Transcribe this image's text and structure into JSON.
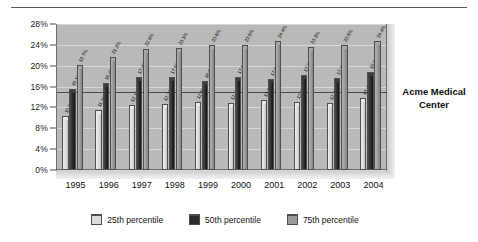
{
  "annotation": {
    "line1": "Acme Medical",
    "line2": "Center"
  },
  "legend": {
    "items": [
      {
        "label": "25th percentile",
        "color": "#dcdcdc"
      },
      {
        "label": "50th percentile",
        "color": "#2b2b2b"
      },
      {
        "label": "75th percentile",
        "color": "#9a9a9a"
      }
    ]
  },
  "chart_data": {
    "type": "bar",
    "title": "",
    "xlabel": "",
    "ylabel": "",
    "ylim": [
      0,
      28
    ],
    "ytick_step": 4,
    "ytick_labels": [
      "0%",
      "4%",
      "8%",
      "12%",
      "16%",
      "20%",
      "24%",
      "28%"
    ],
    "grid": true,
    "legend_position": "bottom",
    "reference_line": 15.0,
    "categories": [
      "1995",
      "1996",
      "1997",
      "1998",
      "1999",
      "2000",
      "2001",
      "2002",
      "2003",
      "2004"
    ],
    "series": [
      {
        "name": "25th percentile",
        "color": "#dcdcdc",
        "values": [
          10.0,
          11.1,
          12.1,
          12.2,
          12.6,
          12.4,
          13.1,
          12.6,
          12.4,
          13.4
        ],
        "labels": [
          "10.0%",
          "11.1%",
          "12.1%",
          "12.2%",
          "12.6%",
          "12.4%",
          "13.1%",
          "12.6%",
          "12.4%",
          "13.4%"
        ]
      },
      {
        "name": "50th percentile",
        "color": "#2b2b2b",
        "values": [
          15.1,
          16.4,
          17.4,
          17.5,
          16.6,
          17.5,
          17.0,
          17.8,
          17.2,
          18.5
        ],
        "labels": [
          "15.1%",
          "16.4%",
          "17.4%",
          "17.5%",
          "16.6%",
          "17.5%",
          "17.0%",
          "17.8%",
          "17.2%",
          "18.5%"
        ]
      },
      {
        "name": "75th percentile",
        "color": "#9a9a9a",
        "values": [
          19.7,
          21.2,
          22.8,
          23.1,
          23.6,
          23.6,
          24.4,
          23.3,
          23.5,
          24.4
        ],
        "labels": [
          "19.7%",
          "21.2%",
          "22.8%",
          "23.1%",
          "23.6%",
          "23.6%",
          "24.4%",
          "23.3%",
          "23.5%",
          "24.4%"
        ]
      }
    ]
  }
}
